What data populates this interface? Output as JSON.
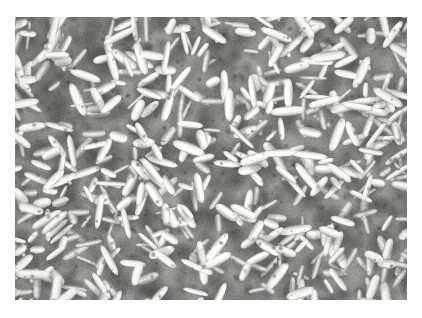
{
  "page": {
    "background_color": "#ffffff",
    "width": 422,
    "height": 318
  },
  "photo": {
    "subject": "uncooked white long-grain rice grains",
    "description": "Dense overhead macro photograph completely filled with raw white long-grain rice kernels lying in random orientations",
    "frame": {
      "x": 15,
      "y": 17,
      "width": 392,
      "height": 283
    },
    "orientation": "landscape",
    "color_mode": "near-grayscale",
    "palette": {
      "grain_highlight": "#ffffff",
      "grain_body": "#f2f2f0",
      "grain_midtone": "#d8d8d6",
      "grain_shade": "#a8a8a6",
      "gap_shadow": "#6b6b6a",
      "deep_shadow": "#2e2e2d",
      "background_bed": "#8f8f8e"
    },
    "grain": {
      "count_estimate": 520,
      "shape": "elongated ellipse",
      "length_px_range": [
        14,
        34
      ],
      "width_px_range": [
        5,
        11
      ],
      "rotation_deg_range": [
        0,
        180
      ]
    },
    "lighting": {
      "direction": "top-left diffuse",
      "contrast": "high",
      "exposure": "bright / blown highlights"
    }
  },
  "caption": {
    "text": ""
  }
}
